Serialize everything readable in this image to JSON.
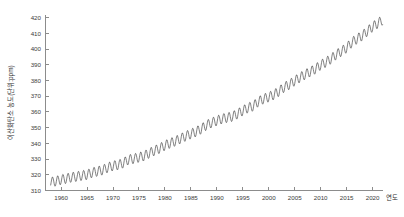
{
  "chart_data": {
    "type": "line",
    "title": "",
    "xlabel": "연도",
    "ylabel": "이산화탄소 농도(단위:ppm)",
    "xlim": [
      1957,
      2022
    ],
    "ylim": [
      310,
      422
    ],
    "grid": false,
    "legend": "none",
    "xticks": [
      1960,
      1965,
      1970,
      1975,
      1980,
      1985,
      1990,
      1995,
      2000,
      2005,
      2010,
      2015,
      2020
    ],
    "xtick_labels": [
      "1960",
      "1965",
      "1970",
      "1975",
      "1980",
      "1985",
      "1990",
      "1995",
      "2000",
      "2005",
      "2010",
      "2015",
      "2020"
    ],
    "yticks": [
      310,
      320,
      330,
      340,
      350,
      360,
      370,
      380,
      390,
      400,
      410,
      420
    ],
    "ytick_labels": [
      "310",
      "320",
      "330",
      "340",
      "350",
      "360",
      "370",
      "380",
      "390",
      "400",
      "410",
      "420"
    ],
    "series_name": "Atmospheric CO2 (Keeling Curve)",
    "line_color": "#333333",
    "axis_color": "#8c8c8c",
    "seasonal_amplitude_ppm": 3.1,
    "annual_mean": {
      "x": [
        1958,
        1959,
        1960,
        1961,
        1962,
        1963,
        1964,
        1965,
        1966,
        1967,
        1968,
        1969,
        1970,
        1971,
        1972,
        1973,
        1974,
        1975,
        1976,
        1977,
        1978,
        1979,
        1980,
        1981,
        1982,
        1983,
        1984,
        1985,
        1986,
        1987,
        1988,
        1989,
        1990,
        1991,
        1992,
        1993,
        1994,
        1995,
        1996,
        1997,
        1998,
        1999,
        2000,
        2001,
        2002,
        2003,
        2004,
        2005,
        2006,
        2007,
        2008,
        2009,
        2010,
        2011,
        2012,
        2013,
        2014,
        2015,
        2016,
        2017,
        2018,
        2019,
        2020,
        2021
      ],
      "y": [
        315.3,
        315.9,
        316.9,
        317.6,
        318.4,
        318.9,
        319.5,
        320.0,
        321.4,
        322.2,
        323.0,
        324.6,
        325.7,
        326.3,
        327.5,
        329.7,
        330.2,
        331.1,
        332.0,
        333.8,
        335.4,
        336.8,
        338.7,
        340.1,
        341.4,
        343.0,
        344.6,
        346.0,
        347.4,
        349.2,
        351.6,
        353.1,
        354.4,
        355.6,
        356.4,
        357.1,
        358.8,
        360.8,
        362.6,
        363.7,
        366.6,
        368.3,
        369.5,
        371.0,
        373.2,
        375.8,
        377.5,
        379.8,
        381.9,
        383.8,
        385.6,
        387.4,
        389.9,
        391.6,
        393.8,
        396.5,
        398.6,
        400.8,
        404.2,
        406.5,
        408.5,
        411.4,
        414.2,
        416.4
      ]
    }
  }
}
